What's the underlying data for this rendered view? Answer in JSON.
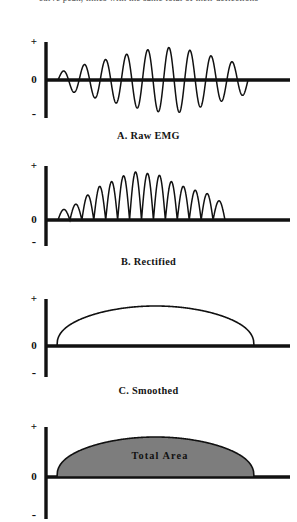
{
  "figure": {
    "top_running_text": "curve peak, times with the same total of their deflections",
    "background_color": "#ffffff",
    "ink_color": "#111111",
    "fill_color": "#7d7d7d"
  },
  "axis": {
    "plus_label": "+",
    "zero_label": "0",
    "minus_label": "-"
  },
  "panels": [
    {
      "id": "a",
      "caption": "A.  Raw  EMG"
    },
    {
      "id": "b",
      "caption": "B.  Rectified"
    },
    {
      "id": "c",
      "caption": "C.  Smoothed"
    },
    {
      "id": "d",
      "caption": "",
      "area_label": "Total  Area"
    }
  ],
  "chart_data": {
    "type": "line",
    "xlabel": "",
    "ylabel": "",
    "grid": false,
    "legend": "none",
    "axis_ticks": [
      "+",
      "0",
      "-"
    ],
    "panels": [
      {
        "key": "raw_emg",
        "label": "A.  Raw  EMG",
        "type": "line",
        "description": "Raw biphasic EMG burst oscillating about zero with a rise-and-fall amplitude envelope",
        "x_start": 58,
        "x_end": 248,
        "cycles": 9,
        "baseline_extent": [
          46,
          290
        ],
        "envelope": [
          0.22,
          0.45,
          0.62,
          0.8,
          0.95,
          1.0,
          0.82,
          0.62,
          0.42
        ],
        "ylim": [
          -1,
          1
        ]
      },
      {
        "key": "rectified",
        "label": "B.  Rectified",
        "type": "area",
        "description": "Full-wave rectified EMG; every deflection folded positive into a row of humps",
        "x_start": 58,
        "x_end": 225,
        "humps": 14,
        "baseline_extent": [
          46,
          290
        ],
        "envelope": [
          0.22,
          0.33,
          0.52,
          0.7,
          0.8,
          0.92,
          1.0,
          0.97,
          0.93,
          0.8,
          0.7,
          0.62,
          0.55,
          0.4
        ],
        "ylim": [
          0,
          1
        ]
      },
      {
        "key": "smoothed",
        "label": "C.  Smoothed",
        "type": "line",
        "description": "Linear-envelope smoothed signal: a single broad dome over the burst",
        "x_start": 57,
        "x_end": 254,
        "peak_x": 150,
        "peak_value": 1.0,
        "baseline_extent": [
          46,
          290
        ],
        "ylim": [
          0,
          1
        ]
      },
      {
        "key": "total_area",
        "label": "Total  Area",
        "type": "area",
        "description": "Smoothed envelope with the region under the curve shaded to show integrated total area",
        "x_start": 57,
        "x_end": 254,
        "peak_x": 150,
        "peak_value": 1.0,
        "fill": "#7d7d7d",
        "baseline_extent": [
          46,
          290
        ],
        "ylim": [
          0,
          1
        ]
      }
    ]
  }
}
